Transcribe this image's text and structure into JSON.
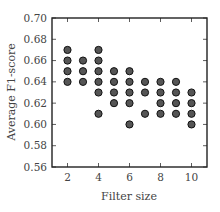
{
  "chart_data": {
    "type": "scatter",
    "title": "",
    "xlabel": "Filter size",
    "ylabel": "Average F1-score",
    "xlim": [
      1,
      11
    ],
    "ylim": [
      0.56,
      0.7
    ],
    "xticks": [
      2,
      4,
      6,
      8,
      10
    ],
    "yticks": [
      0.56,
      0.58,
      0.6,
      0.62,
      0.64,
      0.66,
      0.68,
      0.7
    ],
    "ytick_labels": [
      "0.56",
      "0.58",
      "0.60",
      "0.62",
      "0.64",
      "0.66",
      "0.68",
      "0.70"
    ],
    "xtick_labels": [
      "2",
      "4",
      "6",
      "8",
      "10"
    ],
    "grid": false,
    "legend": null,
    "marker_fill": "#555555",
    "marker_edge": "#111111",
    "points": [
      {
        "x": 2,
        "y": [
          0.67,
          0.66,
          0.65,
          0.64
        ]
      },
      {
        "x": 3,
        "y": [
          0.66,
          0.65,
          0.64
        ]
      },
      {
        "x": 4,
        "y": [
          0.67,
          0.66,
          0.65,
          0.64,
          0.63,
          0.61
        ]
      },
      {
        "x": 5,
        "y": [
          0.65,
          0.64,
          0.63,
          0.62
        ]
      },
      {
        "x": 6,
        "y": [
          0.65,
          0.64,
          0.63,
          0.62,
          0.6
        ]
      },
      {
        "x": 7,
        "y": [
          0.64,
          0.63,
          0.61
        ]
      },
      {
        "x": 8,
        "y": [
          0.64,
          0.63,
          0.62,
          0.61
        ]
      },
      {
        "x": 9,
        "y": [
          0.64,
          0.63,
          0.62,
          0.61
        ]
      },
      {
        "x": 10,
        "y": [
          0.63,
          0.62,
          0.61,
          0.6
        ]
      }
    ]
  }
}
